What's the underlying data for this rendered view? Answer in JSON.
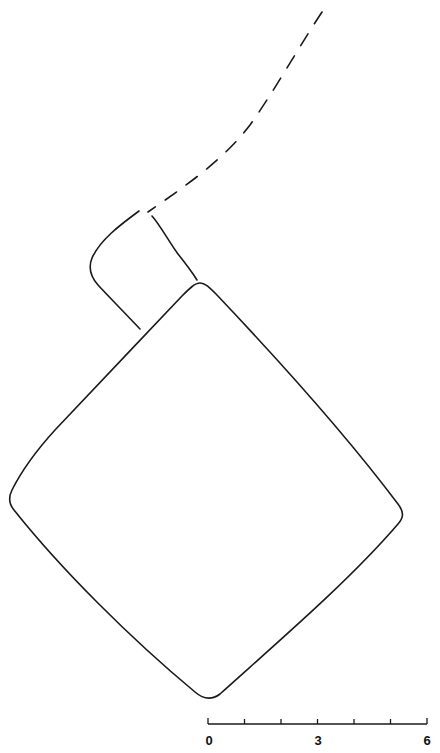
{
  "diagram": {
    "type": "archaeological-plan",
    "features": [
      {
        "name": "main-structure",
        "shape": "rounded-diamond",
        "line": "solid"
      },
      {
        "name": "annex-structure",
        "shape": "rounded-quadrilateral",
        "line": "solid"
      },
      {
        "name": "projected-wall",
        "shape": "curve",
        "line": "dashed"
      }
    ],
    "line_color": "#1a1a1a"
  },
  "scale_bar": {
    "min_label": "0",
    "mid_label": "3",
    "max_label": "6",
    "ticks": 7
  }
}
